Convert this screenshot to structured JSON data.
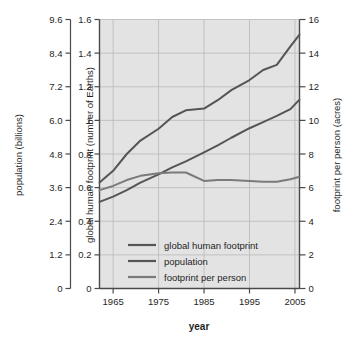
{
  "figure": {
    "name": "global-human-footprint-chart",
    "background_color": "#ffffff",
    "plot_background_color": "#e3e3e3",
    "axis_color": "#4a4a4a",
    "grid_color": "#b9b9b9"
  },
  "chart_data": {
    "type": "line",
    "title": "",
    "xlabel": "year",
    "grid": true,
    "legend_position": "inside-bottom-left",
    "x": [
      1962,
      1965,
      1968,
      1971,
      1975,
      1978,
      1981,
      1985,
      1988,
      1991,
      1995,
      1998,
      2001,
      2004,
      2006
    ],
    "xlim": [
      1962,
      2006
    ],
    "xticks": [
      1965,
      1975,
      1985,
      1995,
      2005
    ],
    "xtick_labels": [
      "1965",
      "1975",
      "1985",
      "1995",
      "2005"
    ],
    "axes": [
      {
        "id": "population-axis",
        "position": "outer-left",
        "label": "population (billions)",
        "ticks": [
          0,
          1.2,
          2.4,
          3.6,
          4.8,
          6.0,
          7.2,
          8.4,
          9.6
        ],
        "tick_labels": [
          "0",
          "1.2",
          "2.4",
          "3.6",
          "4.8",
          "6.0",
          "7.2",
          "8.4",
          "9.6"
        ],
        "lim": [
          0,
          9.6
        ]
      },
      {
        "id": "footprint-axis",
        "position": "inner-left",
        "label": "global human footprint (number of Earths)",
        "ticks": [
          0,
          0.2,
          0.4,
          0.6,
          0.8,
          1,
          1.2,
          1.4,
          1.6
        ],
        "tick_labels": [
          "0",
          "0.2",
          "0.4",
          "0.6",
          "0.8",
          "1",
          "1.2",
          "1.4",
          "1.6"
        ],
        "lim": [
          0,
          1.6
        ]
      },
      {
        "id": "footprint-per-person-axis",
        "position": "right",
        "label": "footprint per person (acres)",
        "ticks": [
          0,
          2,
          4,
          6,
          8,
          10,
          12,
          14,
          16
        ],
        "tick_labels": [
          "0",
          "2",
          "4",
          "6",
          "8",
          "10",
          "12",
          "14",
          "16"
        ],
        "lim": [
          0,
          16
        ]
      }
    ],
    "series": [
      {
        "name": "global human footprint",
        "axis": "footprint-axis",
        "unit": "number of Earths",
        "color": "#555555",
        "values": [
          0.63,
          0.7,
          0.8,
          0.88,
          0.95,
          1.02,
          1.06,
          1.07,
          1.12,
          1.18,
          1.24,
          1.3,
          1.33,
          1.44,
          1.51
        ]
      },
      {
        "name": "population",
        "axis": "population-axis",
        "unit": "billions",
        "color": "#555555",
        "values": [
          3.09,
          3.28,
          3.51,
          3.78,
          4.07,
          4.32,
          4.54,
          4.86,
          5.11,
          5.38,
          5.72,
          5.94,
          6.16,
          6.4,
          6.74
        ]
      },
      {
        "name": "footprint per person",
        "axis": "footprint-per-person-axis",
        "unit": "acres",
        "color": "#7a7a7a",
        "values": [
          5.85,
          6.1,
          6.45,
          6.7,
          6.85,
          6.9,
          6.9,
          6.4,
          6.45,
          6.45,
          6.4,
          6.35,
          6.35,
          6.5,
          6.65
        ]
      }
    ]
  },
  "legend": {
    "entries": [
      {
        "label": "global human footprint",
        "color": "#555555"
      },
      {
        "label": "population",
        "color": "#555555"
      },
      {
        "label": "footprint per person",
        "color": "#7a7a7a"
      }
    ]
  }
}
